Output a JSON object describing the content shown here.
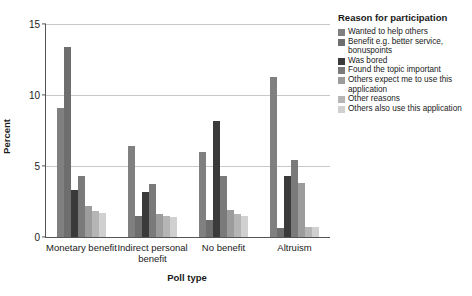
{
  "chart_data": {
    "type": "bar",
    "title": "",
    "xlabel": "Poll type",
    "ylabel": "Percent",
    "ylim": [
      0,
      15
    ],
    "yticks": [
      0,
      5,
      10,
      15
    ],
    "grid": true,
    "legend_position": "right",
    "legend_title": "Reason for participation",
    "categories": [
      "Monetary benefit",
      "Indirect personal benefit",
      "No benefit",
      "Altruism"
    ],
    "series": [
      {
        "name": "Wanted to help others",
        "color": "#808080",
        "values": [
          9.1,
          6.4,
          6.0,
          11.3
        ]
      },
      {
        "name": "Benefit e.g. better service, bonuspoints",
        "color": "#6e6e6e",
        "values": [
          13.4,
          1.5,
          1.2,
          0.6
        ]
      },
      {
        "name": "Was bored",
        "color": "#3a3a3a",
        "values": [
          3.3,
          3.2,
          8.2,
          4.3
        ]
      },
      {
        "name": "Found the topic important",
        "color": "#7a7a7a",
        "values": [
          4.3,
          3.7,
          4.3,
          5.4
        ]
      },
      {
        "name": "Others expect me to use this application",
        "color": "#9c9c9c",
        "values": [
          2.2,
          1.6,
          1.9,
          3.8
        ]
      },
      {
        "name": "Other reasons",
        "color": "#b5b5b5",
        "values": [
          1.8,
          1.5,
          1.6,
          0.7
        ]
      },
      {
        "name": "Others also use this application",
        "color": "#d0d0d0",
        "values": [
          1.7,
          1.4,
          1.5,
          0.7
        ]
      }
    ]
  }
}
